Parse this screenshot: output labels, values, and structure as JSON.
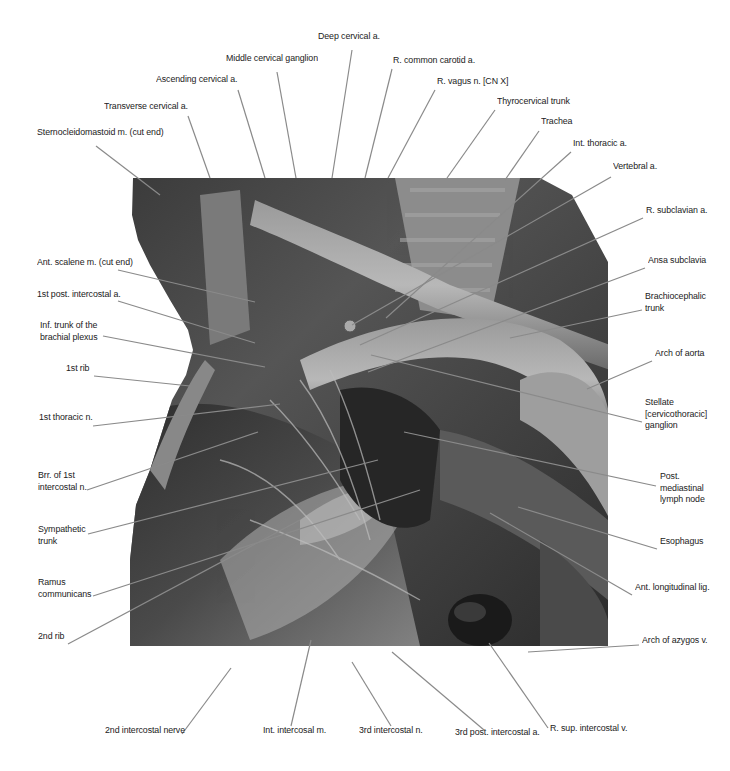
{
  "figure": {
    "photo_colors": {
      "dark": "#1e1e1e",
      "mid": "#6e6e6e",
      "light": "#b9b9b9",
      "leader": "#8a8a8a"
    }
  },
  "labels": {
    "top": [
      {
        "id": "deep-cervical-a",
        "text": "Deep cervical a.",
        "x": 318,
        "y": 38
      },
      {
        "id": "middle-cervical-ganglion",
        "text": "Middle cervical ganglion",
        "x": 226,
        "y": 60
      },
      {
        "id": "r-common-carotid-a",
        "text": "R. common carotid a.",
        "x": 393,
        "y": 62
      },
      {
        "id": "ascending-cervical-a",
        "text": "Ascending cervical a.",
        "x": 156,
        "y": 81
      },
      {
        "id": "r-vagus-n",
        "text": "R. vagus n. [CN X]",
        "x": 437,
        "y": 83
      },
      {
        "id": "thyrocervical-trunk",
        "text": "Thyrocervical trunk",
        "x": 497,
        "y": 103
      },
      {
        "id": "transverse-cervical-a",
        "text": "Transverse cervical a.",
        "x": 104,
        "y": 108
      },
      {
        "id": "trachea",
        "text": "Trachea",
        "x": 541,
        "y": 123
      },
      {
        "id": "sternocleidomastoid-m",
        "text": "Sternocleidomastoid m. (cut end)",
        "x": 37,
        "y": 134
      },
      {
        "id": "int-thoracic-a",
        "text": "Int. thoracic a.",
        "x": 573,
        "y": 145
      },
      {
        "id": "vertebral-a",
        "text": "Vertebral a.",
        "x": 613,
        "y": 168
      }
    ],
    "left": [
      {
        "id": "ant-scalene-m",
        "text": "Ant. scalene m. (cut end)",
        "x": 37,
        "y": 264
      },
      {
        "id": "1st-post-intercostal-a",
        "text": "1st post. intercostal a.",
        "x": 37,
        "y": 296
      },
      {
        "id": "inf-trunk-brachial-plexus",
        "text": "Inf. trunk of the\nbrachial plexus",
        "x": 40,
        "y": 327
      },
      {
        "id": "1st-rib",
        "text": "1st rib",
        "x": 66,
        "y": 370
      },
      {
        "id": "1st-thoracic-n",
        "text": "1st thoracic n.",
        "x": 39,
        "y": 419
      },
      {
        "id": "brr-1st-intercostal-n",
        "text": "Brr. of 1st\nintercostal n.",
        "x": 38,
        "y": 477
      },
      {
        "id": "sympathetic-trunk",
        "text": "Sympathetic\ntrunk",
        "x": 38,
        "y": 531
      },
      {
        "id": "ramus-communicans",
        "text": "Ramus\ncommunicans",
        "x": 38,
        "y": 584
      },
      {
        "id": "2nd-rib",
        "text": "2nd rib",
        "x": 38,
        "y": 638
      }
    ],
    "right": [
      {
        "id": "r-subclavian-a",
        "text": "R. subclavian a.",
        "x": 646,
        "y": 212
      },
      {
        "id": "ansa-subclavia",
        "text": "Ansa subclavia",
        "x": 648,
        "y": 262
      },
      {
        "id": "brachiocephalic-trunk",
        "text": "Brachiocephalic\ntrunk",
        "x": 645,
        "y": 298
      },
      {
        "id": "arch-of-aorta",
        "text": "Arch of aorta",
        "x": 655,
        "y": 355
      },
      {
        "id": "stellate-ganglion",
        "text": "Stellate\n[cervicothoracic]\nganglion",
        "x": 645,
        "y": 404
      },
      {
        "id": "post-mediastinal-lymph-node",
        "text": "Post.\nmediastinal\nlymph node",
        "x": 660,
        "y": 478
      },
      {
        "id": "esophagus",
        "text": "Esophagus",
        "x": 660,
        "y": 543
      },
      {
        "id": "ant-longitudinal-lig",
        "text": "Ant. longitudinal lig.",
        "x": 635,
        "y": 589
      },
      {
        "id": "arch-of-azygos-v",
        "text": "Arch of azygos v.",
        "x": 642,
        "y": 642
      }
    ],
    "bottom": [
      {
        "id": "2nd-intercostal-nerve",
        "text": "2nd intercostal nerve",
        "x": 105,
        "y": 732
      },
      {
        "id": "int-intercosal-m",
        "text": "Int. intercosal m.",
        "x": 263,
        "y": 732
      },
      {
        "id": "3rd-intercostal-n",
        "text": "3rd intercostal n.",
        "x": 359,
        "y": 732
      },
      {
        "id": "3rd-post-intercostal-a",
        "text": "3rd post. intercostal a.",
        "x": 455,
        "y": 734
      },
      {
        "id": "r-sup-intercostal-v",
        "text": "R. sup. intercostal v.",
        "x": 550,
        "y": 730
      }
    ]
  },
  "leaders": [
    {
      "id": "deep-cervical-a",
      "x1": 352,
      "y1": 50,
      "x2": 332,
      "y2": 178
    },
    {
      "id": "middle-cervical-ganglion",
      "x1": 277,
      "y1": 72,
      "x2": 296,
      "y2": 178
    },
    {
      "id": "r-common-carotid-a",
      "x1": 392,
      "y1": 69,
      "x2": 365,
      "y2": 178
    },
    {
      "id": "ascending-cervical-a",
      "x1": 238,
      "y1": 90,
      "x2": 265,
      "y2": 178
    },
    {
      "id": "r-vagus-n",
      "x1": 435,
      "y1": 90,
      "x2": 388,
      "y2": 178
    },
    {
      "id": "thyrocervical-trunk",
      "x1": 495,
      "y1": 110,
      "x2": 447,
      "y2": 178
    },
    {
      "id": "transverse-cervical-a",
      "x1": 188,
      "y1": 116,
      "x2": 210,
      "y2": 178
    },
    {
      "id": "trachea",
      "x1": 539,
      "y1": 131,
      "x2": 505,
      "y2": 180
    },
    {
      "id": "sternocleidomastoid-m",
      "x1": 96,
      "y1": 146,
      "x2": 160,
      "y2": 195
    },
    {
      "id": "int-thoracic-a",
      "x1": 571,
      "y1": 152,
      "x2": 386,
      "y2": 318
    },
    {
      "id": "vertebral-a",
      "x1": 611,
      "y1": 177,
      "x2": 352,
      "y2": 325
    },
    {
      "id": "r-subclavian-a",
      "x1": 643,
      "y1": 218,
      "x2": 360,
      "y2": 345
    },
    {
      "id": "ansa-subclavia",
      "x1": 645,
      "y1": 268,
      "x2": 368,
      "y2": 372
    },
    {
      "id": "brachiocephalic-trunk",
      "x1": 642,
      "y1": 310,
      "x2": 510,
      "y2": 338
    },
    {
      "id": "arch-of-aorta",
      "x1": 652,
      "y1": 361,
      "x2": 587,
      "y2": 389
    },
    {
      "id": "stellate-ganglion",
      "x1": 642,
      "y1": 422,
      "x2": 371,
      "y2": 355
    },
    {
      "id": "post-mediastinal-lymph-node",
      "x1": 656,
      "y1": 486,
      "x2": 404,
      "y2": 432
    },
    {
      "id": "esophagus",
      "x1": 657,
      "y1": 549,
      "x2": 518,
      "y2": 507
    },
    {
      "id": "ant-longitudinal-lig",
      "x1": 632,
      "y1": 595,
      "x2": 490,
      "y2": 513
    },
    {
      "id": "arch-of-azygos-v",
      "x1": 639,
      "y1": 645,
      "x2": 528,
      "y2": 652
    },
    {
      "id": "ant-scalene-m",
      "x1": 118,
      "y1": 270,
      "x2": 255,
      "y2": 302
    },
    {
      "id": "1st-post-intercostal-a",
      "x1": 118,
      "y1": 301,
      "x2": 255,
      "y2": 343
    },
    {
      "id": "inf-trunk-brachial-plexus",
      "x1": 103,
      "y1": 336,
      "x2": 265,
      "y2": 367
    },
    {
      "id": "1st-rib",
      "x1": 94,
      "y1": 376,
      "x2": 190,
      "y2": 386
    },
    {
      "id": "1st-thoracic-n",
      "x1": 93,
      "y1": 426,
      "x2": 280,
      "y2": 404
    },
    {
      "id": "brr-1st-intercostal-n",
      "x1": 87,
      "y1": 490,
      "x2": 258,
      "y2": 432
    },
    {
      "id": "sympathetic-trunk",
      "x1": 88,
      "y1": 534,
      "x2": 378,
      "y2": 460
    },
    {
      "id": "ramus-communicans",
      "x1": 93,
      "y1": 596,
      "x2": 420,
      "y2": 490
    },
    {
      "id": "2nd-rib",
      "x1": 68,
      "y1": 644,
      "x2": 300,
      "y2": 520
    },
    {
      "id": "2nd-intercostal-nerve",
      "x1": 182,
      "y1": 734,
      "x2": 231,
      "y2": 668
    },
    {
      "id": "int-intercosal-m",
      "x1": 291,
      "y1": 726,
      "x2": 311,
      "y2": 640
    },
    {
      "id": "3rd-intercostal-n",
      "x1": 391,
      "y1": 726,
      "x2": 352,
      "y2": 662
    },
    {
      "id": "3rd-post-intercostal-a",
      "x1": 484,
      "y1": 730,
      "x2": 392,
      "y2": 652
    },
    {
      "id": "r-sup-intercostal-v",
      "x1": 548,
      "y1": 728,
      "x2": 489,
      "y2": 643
    }
  ]
}
